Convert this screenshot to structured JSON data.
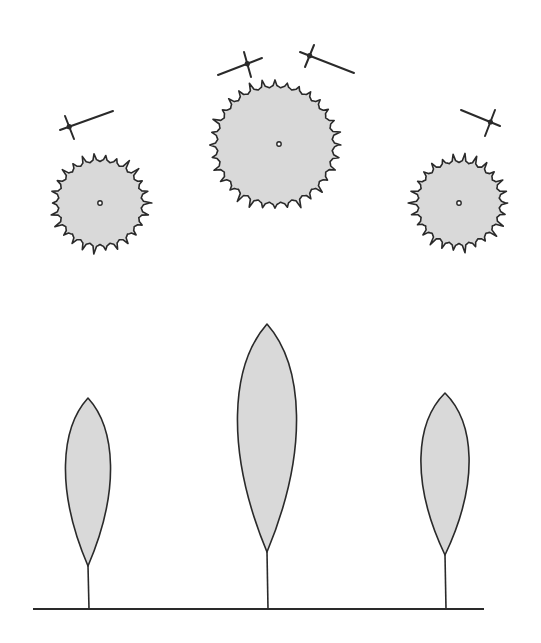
{
  "colors": {
    "background": "#ffffff",
    "canopy_fill": "#d9d9d9",
    "stroke": "#2a2a2a"
  },
  "plan_view": {
    "trees": [
      {
        "name": "left",
        "cx": 100,
        "cy": 203,
        "r": 44,
        "spikes": 26,
        "center_dot": [
          100,
          203
        ]
      },
      {
        "name": "middle",
        "cx": 275,
        "cy": 145,
        "r": 60,
        "spikes": 32,
        "center_dot": [
          279,
          144
        ]
      },
      {
        "name": "right",
        "cx": 459,
        "cy": 203,
        "r": 43,
        "spikes": 26,
        "center_dot": [
          459,
          203
        ]
      }
    ],
    "sun_markers": [
      {
        "name": "left",
        "line": [
          [
            60,
            130
          ],
          [
            113,
            111
          ]
        ],
        "cross": [
          [
            65,
            116
          ],
          [
            74,
            139
          ]
        ]
      },
      {
        "name": "middle-left",
        "line": [
          [
            218,
            75
          ],
          [
            262,
            58
          ]
        ],
        "cross": [
          [
            244,
            52
          ],
          [
            251,
            77
          ]
        ]
      },
      {
        "name": "middle-right",
        "line": [
          [
            300,
            52
          ],
          [
            354,
            73
          ]
        ],
        "cross": [
          [
            314,
            45
          ],
          [
            305,
            67
          ]
        ]
      },
      {
        "name": "right",
        "line": [
          [
            461,
            110
          ],
          [
            500,
            126
          ]
        ],
        "cross": [
          [
            495,
            110
          ],
          [
            485,
            136
          ]
        ]
      }
    ]
  },
  "elevation_view": {
    "ground": {
      "x1": 33,
      "x2": 484,
      "y": 609
    },
    "trees": [
      {
        "name": "left",
        "x": 88,
        "top": 398,
        "bottom": 566,
        "half_width": 29
      },
      {
        "name": "middle",
        "x": 267,
        "top": 324,
        "bottom": 552,
        "half_width": 38
      },
      {
        "name": "right",
        "x": 445,
        "top": 393,
        "bottom": 555,
        "half_width": 31
      }
    ]
  }
}
